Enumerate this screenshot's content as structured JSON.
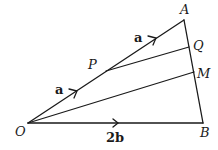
{
  "diagram": {
    "type": "vector-triangle",
    "points": {
      "O": {
        "label": "O",
        "x": 28,
        "y": 123
      },
      "A": {
        "label": "A",
        "x": 184,
        "y": 20
      },
      "B": {
        "label": "B",
        "x": 203,
        "y": 123
      },
      "P": {
        "label": "P",
        "x": 106,
        "y": 71
      },
      "Q": {
        "label": "Q",
        "x": 189,
        "y": 47
      },
      "M": {
        "label": "M",
        "x": 194,
        "y": 72
      }
    },
    "segments": [
      {
        "from": "O",
        "to": "A"
      },
      {
        "from": "A",
        "to": "B"
      },
      {
        "from": "O",
        "to": "B"
      },
      {
        "from": "P",
        "to": "Q"
      },
      {
        "from": "O",
        "to": "M"
      }
    ],
    "vector_labels": {
      "op": "a",
      "pa": "a",
      "ob": "2b"
    }
  }
}
